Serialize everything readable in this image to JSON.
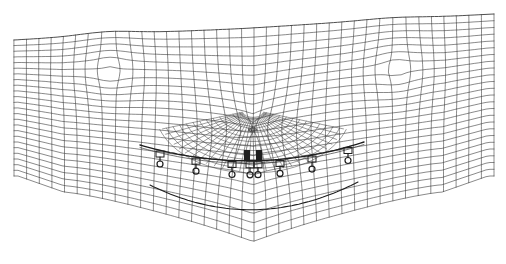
{
  "figure": {
    "type": "wireframe-mesh",
    "background": "#ffffff",
    "stroke_color": "#3a3a3a",
    "dense_color": "#1e1e1e",
    "width": 506,
    "height": 264,
    "center_x": 253,
    "mesh": {
      "left": 14,
      "right": 494,
      "top_left_y": 40,
      "top_center_y": 18,
      "top_right_y": 14,
      "columns": 38,
      "rows": 24
    },
    "fixtures": {
      "count": 9,
      "xs": [
        160,
        196,
        232,
        250,
        258,
        280,
        312,
        348
      ],
      "curve": [
        [
          140,
          145
        ],
        [
          253,
          178
        ],
        [
          364,
          142
        ]
      ],
      "lower_curve": [
        [
          150,
          185
        ],
        [
          253,
          236
        ],
        [
          358,
          182
        ]
      ]
    },
    "nose": {
      "x": 253,
      "y": 148,
      "width": 26,
      "height": 22
    }
  }
}
